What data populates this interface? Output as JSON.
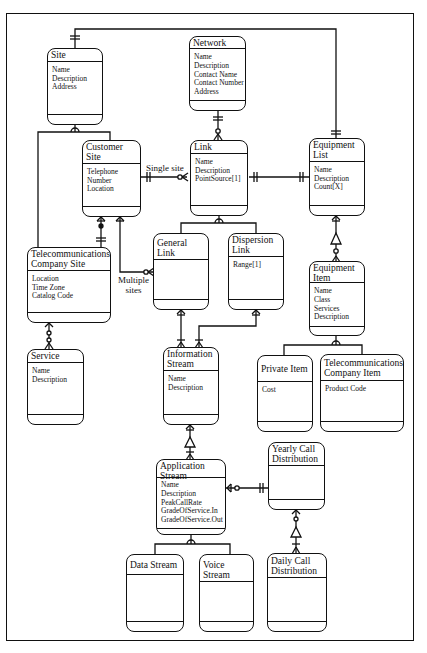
{
  "diagram": {
    "type": "entity-relationship",
    "entities": [
      {
        "id": "site",
        "title": "Site",
        "attributes": [
          "Name",
          "Description",
          "Address"
        ]
      },
      {
        "id": "network",
        "title": "Network",
        "attributes": [
          "Name",
          "Description",
          "Contact Name",
          "Contact Number",
          "Address"
        ]
      },
      {
        "id": "customer_site",
        "title": "Customer Site",
        "attributes": [
          "Telephone",
          "Number",
          "Location"
        ]
      },
      {
        "id": "link",
        "title": "Link",
        "attributes": [
          "Name",
          "Description",
          "PointSource[1]"
        ]
      },
      {
        "id": "equipment_list",
        "title": "Equipment\nList",
        "attributes": [
          "Name",
          "Description",
          "Count[X]"
        ]
      },
      {
        "id": "telecom_site",
        "title": "Telecommunications\nCompany Site",
        "attributes": [
          "Location",
          "Time Zone",
          "Catalog Code"
        ]
      },
      {
        "id": "general_link",
        "title": "General Link",
        "attributes": []
      },
      {
        "id": "dispersion_link",
        "title": "Dispersion\nLink",
        "attributes": [
          "Range[1]"
        ]
      },
      {
        "id": "equipment_item",
        "title": "Equipment\nItem",
        "attributes": [
          "Name",
          "Class",
          "Services",
          "Description"
        ]
      },
      {
        "id": "service",
        "title": "Service",
        "attributes": [
          "Name",
          "Description"
        ]
      },
      {
        "id": "information_stream",
        "title": "Information\nStream",
        "attributes": [
          "Name",
          "Description"
        ]
      },
      {
        "id": "private_item",
        "title": "Private Item",
        "attributes": [
          "Cost"
        ]
      },
      {
        "id": "telecom_item",
        "title": "Telecommunications\nCompany Item",
        "attributes": [
          "Product Code"
        ]
      },
      {
        "id": "application_stream",
        "title": "Application\nStream",
        "attributes": [
          "Name",
          "Description",
          "PeakCallRate",
          "GradeOfService.In",
          "GradeOfService.Out"
        ]
      },
      {
        "id": "yearly_call",
        "title": "Yearly Call\nDistribution",
        "attributes": []
      },
      {
        "id": "data_stream",
        "title": "Data Stream",
        "attributes": []
      },
      {
        "id": "voice_stream",
        "title": "Voice Stream",
        "attributes": []
      },
      {
        "id": "daily_call",
        "title": "Daily Call\nDistribution",
        "attributes": []
      }
    ],
    "relationship_labels": {
      "single_site": "Single site",
      "multiple_sites": "Multiple\nsites"
    },
    "relationships": [
      {
        "from": "site",
        "to": "equipment_list",
        "type": "one-to-one"
      },
      {
        "from": "site",
        "to": "customer_site",
        "type": "subtype"
      },
      {
        "from": "site",
        "to": "telecom_site",
        "type": "subtype"
      },
      {
        "from": "network",
        "to": "link",
        "type": "one-to-zero-or-many"
      },
      {
        "from": "customer_site",
        "to": "link",
        "type": "one-to-zero-or-many",
        "label": "Single site"
      },
      {
        "from": "customer_site",
        "to": "general_link",
        "type": "many-to-zero-or-many",
        "label": "Multiple sites"
      },
      {
        "from": "customer_site",
        "to": "telecom_site",
        "type": "many-to-one"
      },
      {
        "from": "link",
        "to": "equipment_list",
        "type": "one-to-one"
      },
      {
        "from": "link",
        "to": "general_link",
        "type": "subtype"
      },
      {
        "from": "link",
        "to": "dispersion_link",
        "type": "subtype"
      },
      {
        "from": "equipment_list",
        "to": "equipment_item",
        "type": "many-to-many"
      },
      {
        "from": "telecom_site",
        "to": "service",
        "type": "one-to-zero-or-many"
      },
      {
        "from": "general_link",
        "to": "information_stream",
        "type": "many-to-many"
      },
      {
        "from": "dispersion_link",
        "to": "information_stream",
        "type": "many-to-many"
      },
      {
        "from": "equipment_item",
        "to": "private_item",
        "type": "subtype"
      },
      {
        "from": "equipment_item",
        "to": "telecom_item",
        "type": "subtype"
      },
      {
        "from": "information_stream",
        "to": "application_stream",
        "type": "many-to-many"
      },
      {
        "from": "application_stream",
        "to": "yearly_call",
        "type": "zero-or-many-to-one"
      },
      {
        "from": "application_stream",
        "to": "data_stream",
        "type": "subtype"
      },
      {
        "from": "application_stream",
        "to": "voice_stream",
        "type": "subtype"
      },
      {
        "from": "yearly_call",
        "to": "daily_call",
        "type": "many-to-many"
      }
    ]
  }
}
